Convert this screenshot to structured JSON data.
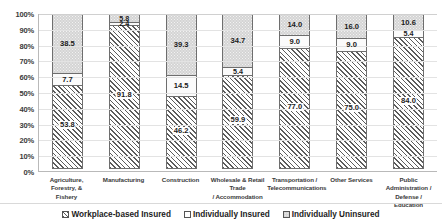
{
  "chart_data": {
    "type": "bar",
    "subtype": "100% stacked column",
    "title": "",
    "xlabel": "",
    "ylabel": "",
    "ylim": [
      0,
      100
    ],
    "ytick_labels": [
      "100%",
      "90%",
      "80%",
      "70%",
      "60%",
      "50%",
      "40%",
      "30%",
      "20%",
      "10%",
      "0%"
    ],
    "ytick_values": [
      100,
      90,
      80,
      70,
      60,
      50,
      40,
      30,
      20,
      10,
      0
    ],
    "grid": true,
    "legend_position": "bottom",
    "categories": [
      "Agriculture, Forestry, & Fishery",
      "Manufacturing",
      "Construction",
      "Wholesale & Retail Trade / Accommodation",
      "Transportation / Telecommunications",
      "Other Services",
      "Public Administration / Defense / Education"
    ],
    "category_lines": [
      [
        "Agriculture, Forestry, &",
        "Fishery"
      ],
      [
        "Manufacturing"
      ],
      [
        "Construction"
      ],
      [
        "Wholesale & Retail Trade",
        "/ Accommodation"
      ],
      [
        "Transportation /",
        "Telecommunications"
      ],
      [
        "Other Services"
      ],
      [
        "Public Administration /",
        "Defense / Education"
      ]
    ],
    "series": [
      {
        "name": "Workplace-based Insured",
        "pattern": "diagonal-hatch",
        "values": [
          53.8,
          91.8,
          46.2,
          59.9,
          77.0,
          75.0,
          84.0
        ],
        "labels": [
          "53.8",
          "91.8",
          "46.2",
          "59.9",
          "77.0",
          "75.0",
          "84.0"
        ]
      },
      {
        "name": "Individually Insured",
        "pattern": "solid-white",
        "values": [
          7.7,
          2.4,
          14.5,
          5.4,
          9.0,
          9.0,
          5.4
        ],
        "labels": [
          "7.7",
          "2.4",
          "14.5",
          "5.4",
          "9.0",
          "9.0",
          "5.4"
        ]
      },
      {
        "name": "Individually Uninsured",
        "pattern": "grey-stipple",
        "values": [
          38.5,
          5.8,
          39.3,
          34.7,
          14.0,
          16.0,
          10.6
        ],
        "labels": [
          "38.5",
          "5.8",
          "39.3",
          "34.7",
          "14.0",
          "16.0",
          "10.6"
        ]
      }
    ]
  },
  "legend": {
    "items": [
      {
        "label": "Workplace-based Insured",
        "swatch": "hatch-swatch-icon"
      },
      {
        "label": "Individually Insured",
        "swatch": "white-swatch-icon"
      },
      {
        "label": "Individually Uninsured",
        "swatch": "stipple-swatch-icon"
      }
    ]
  },
  "colors": {
    "hatch_line": "#5c5c5c",
    "stipple_fill": "#d4d4d4",
    "individual_fill": "#fbfbfb",
    "segment_border": "#6e6e6e",
    "gridline": "#e3e3e3",
    "axis": "#b9b9b9",
    "text": "#1c1c1c"
  }
}
